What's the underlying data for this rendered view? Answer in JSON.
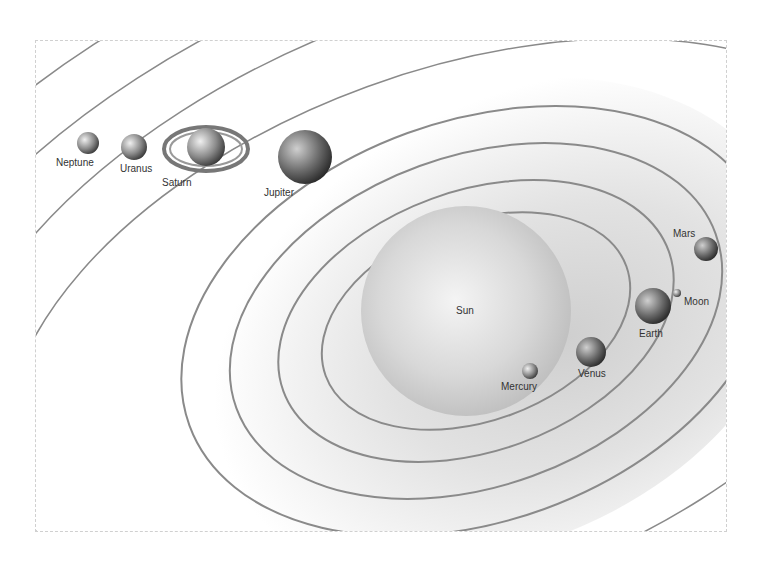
{
  "diagram": {
    "bodies": [
      {
        "name": "Sun",
        "label": "Sun"
      },
      {
        "name": "Mercury",
        "label": "Mercury"
      },
      {
        "name": "Venus",
        "label": "Venus"
      },
      {
        "name": "Earth",
        "label": "Earth"
      },
      {
        "name": "Moon",
        "label": "Moon"
      },
      {
        "name": "Mars",
        "label": "Mars"
      },
      {
        "name": "Jupiter",
        "label": "Jupiter"
      },
      {
        "name": "Saturn",
        "label": "Saturn"
      },
      {
        "name": "Uranus",
        "label": "Uranus"
      },
      {
        "name": "Neptune",
        "label": "Neptune"
      }
    ]
  }
}
